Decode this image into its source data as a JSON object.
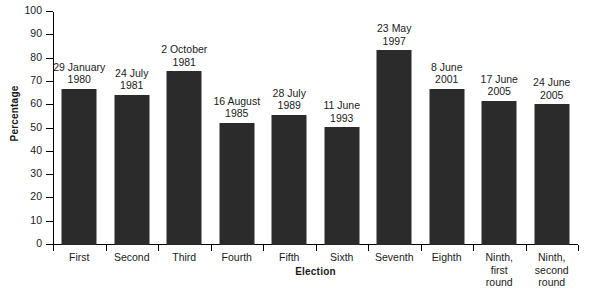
{
  "chart_data": {
    "type": "bar",
    "title": "",
    "xlabel": "Election",
    "ylabel": "Percentage",
    "ylim": [
      0,
      100
    ],
    "ytick_values": [
      0,
      10,
      20,
      30,
      40,
      50,
      60,
      70,
      80,
      90,
      100
    ],
    "ytick_labels": [
      "0",
      "10",
      "20",
      "30",
      "40",
      "50",
      "60",
      "70",
      "80",
      "90",
      "100"
    ],
    "grid": false,
    "legend": "none",
    "bar_color": "#2b2b2b",
    "categories": [
      "First",
      "Second",
      "Third",
      "Fourth",
      "Fifth",
      "Sixth",
      "Seventh",
      "Eighth",
      "Ninth, first round",
      "Ninth, second round"
    ],
    "category_label_lines": [
      [
        "First"
      ],
      [
        "Second"
      ],
      [
        "Third"
      ],
      [
        "Fourth"
      ],
      [
        "Fifth"
      ],
      [
        "Sixth"
      ],
      [
        "Seventh"
      ],
      [
        "Eighth"
      ],
      [
        "Ninth,",
        "first",
        "round"
      ],
      [
        "Ninth,",
        "second",
        "round"
      ]
    ],
    "values": [
      67,
      64.5,
      74.5,
      52.5,
      56,
      50.5,
      83.5,
      67,
      62,
      60.5
    ],
    "point_labels": [
      "29 January 1980",
      "24 July 1981",
      "2 October 1981",
      "16 August 1985",
      "28 July 1989",
      "11 June 1993",
      "23 May 1997",
      "8 June 2001",
      "17 June 2005",
      "24 June 2005"
    ],
    "point_label_lines": [
      [
        "29 January",
        "1980"
      ],
      [
        "24 July",
        "1981"
      ],
      [
        "2 October",
        "1981"
      ],
      [
        "16 August",
        "1985"
      ],
      [
        "28 July",
        "1989"
      ],
      [
        "11 June",
        "1993"
      ],
      [
        "23 May",
        "1997"
      ],
      [
        "8 June",
        "2001"
      ],
      [
        "17 June",
        "2005"
      ],
      [
        "24 June",
        "2005"
      ]
    ]
  }
}
